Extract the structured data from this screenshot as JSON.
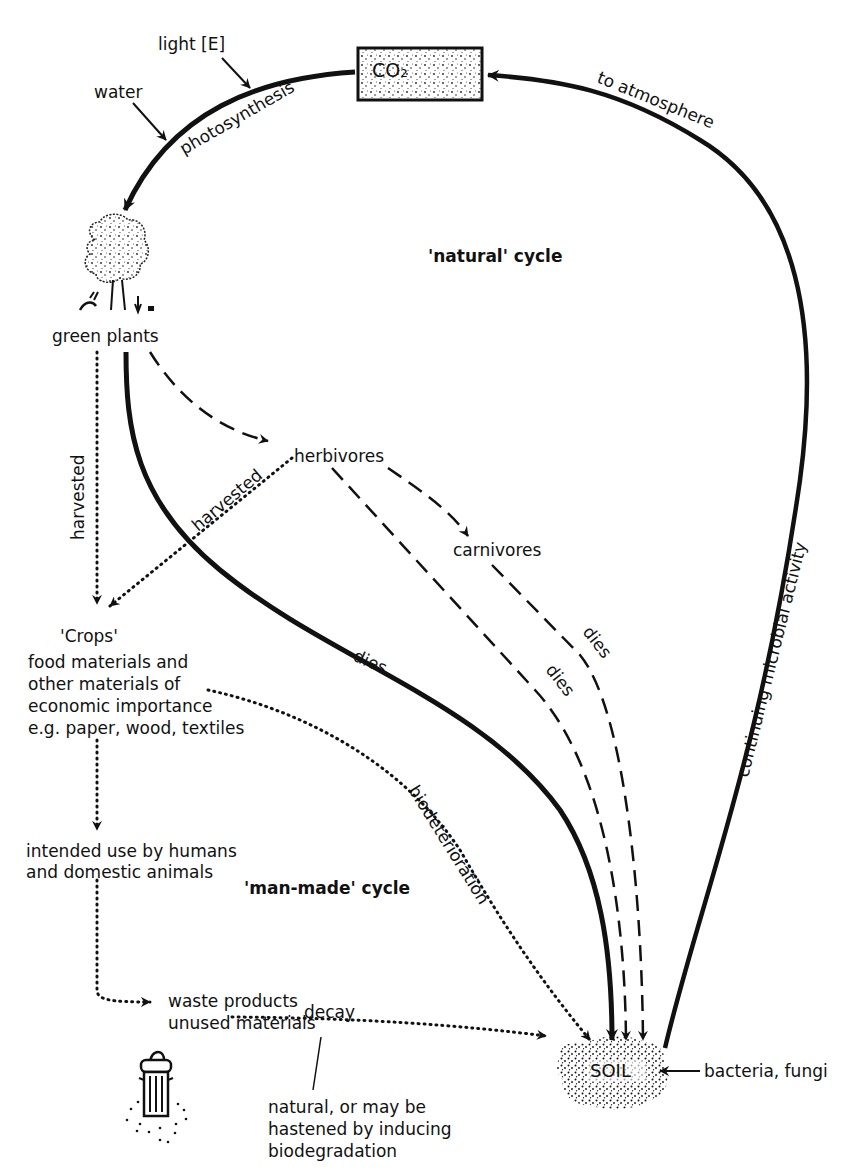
{
  "diagram": {
    "nodes": {
      "co2": "CO₂",
      "green_plants": "green plants",
      "herbivores": "herbivores",
      "carnivores": "carnivores",
      "crops_title": "'Crops'",
      "crops_desc": [
        "food materials and",
        "other materials of",
        "economic importance",
        "e.g. paper, wood, textiles"
      ],
      "intended_use": [
        "intended use by humans",
        "and domestic animals"
      ],
      "waste": [
        "waste products",
        "unused materials"
      ],
      "soil": "SOIL",
      "bacteria": "bacteria, fungi"
    },
    "inputs": {
      "light": "light [E]",
      "water": "water"
    },
    "edge_labels": {
      "photosynthesis": "photosynthesis",
      "to_atmosphere": "to atmosphere",
      "continuing_microbial": "continuing microbial activity",
      "harvested_vertical": "harvested",
      "harvested_diagonal": "harvested",
      "plants_dies": "dies",
      "herbivores_dies": "dies",
      "carnivores_dies": "dies",
      "biodeterioration": "biodeterioration",
      "decay": "decay"
    },
    "cycle_labels": {
      "natural": "'natural' cycle",
      "man_made": "'man-made' cycle"
    },
    "note": [
      "natural, or may be",
      "hastened by inducing",
      "biodegradation"
    ],
    "icons": [
      "tree-icon",
      "trash-can-icon",
      "soil-stipple-icon",
      "co2-box-icon"
    ],
    "colors": {
      "ink": "#111111",
      "background": "#ffffff"
    }
  }
}
